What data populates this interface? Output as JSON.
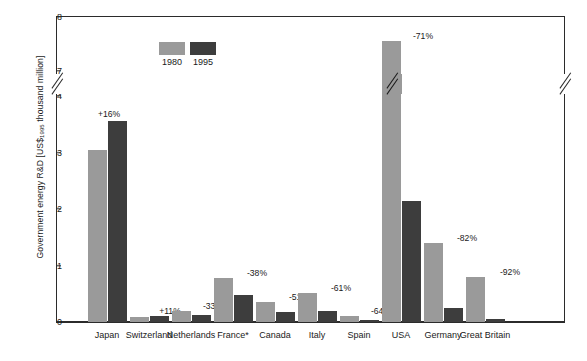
{
  "chart_data": {
    "type": "bar",
    "title": "",
    "xlabel": "",
    "ylabel": "Government energy R&D [US$1995 thousand million]",
    "ylabel_prefix": "Government energy R&D [US$",
    "ylabel_sub": "1995",
    "ylabel_suffix": " thousand million]",
    "categories": [
      "Japan",
      "Switzerland",
      "Netherlands",
      "France*",
      "Canada",
      "Italy",
      "Spain",
      "USA",
      "Germany",
      "Great Britain"
    ],
    "series": [
      {
        "name": "1980",
        "color": "#9a9a9a",
        "values": [
          3.05,
          0.09,
          0.19,
          0.77,
          0.35,
          0.52,
          0.11,
          7.55,
          1.4,
          0.8
        ]
      },
      {
        "name": "1995",
        "color": "#3d3d3d",
        "values": [
          3.55,
          0.1,
          0.13,
          0.48,
          0.17,
          0.2,
          0.04,
          2.15,
          0.25,
          0.06
        ]
      }
    ],
    "change_labels": [
      "+16%",
      "+11%",
      "-33%",
      "-38%",
      "-51%",
      "-61%",
      "-64%",
      "-71%",
      "-82%",
      "-92%"
    ],
    "ytick_labels": [
      "0",
      "1",
      "2",
      "3",
      "4",
      "7",
      "8"
    ],
    "ytick_values": [
      0,
      1,
      2,
      3,
      4,
      7,
      8
    ],
    "ylim": [
      0,
      8
    ],
    "axis_break": {
      "present": true,
      "between": [
        4,
        7
      ]
    },
    "grid": false,
    "legend": {
      "position": "top-left-inside",
      "entries": [
        "1980",
        "1995"
      ]
    },
    "footnote_marker": "*"
  },
  "legend": {
    "entries": [
      {
        "label": "1980",
        "color": "#9a9a9a"
      },
      {
        "label": "1995",
        "color": "#3d3d3d"
      }
    ]
  }
}
